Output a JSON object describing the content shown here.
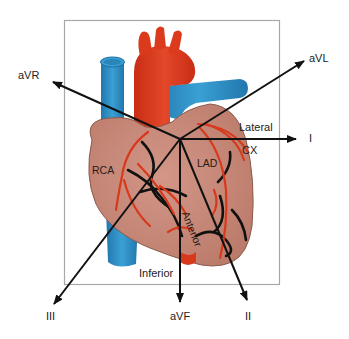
{
  "figure": {
    "type": "hexaxial-reference-diagram",
    "colors": {
      "background": "#ffffff",
      "frame": "#a8a8a8",
      "myocardium": "#c8897a",
      "myocardium_outline": "#8a5a4c",
      "aorta": "#dc3a1c",
      "vena_cava": "#2f8fc4",
      "coronary_artery": "#d8391c",
      "coronary_vein": "#111111",
      "axis_arrow": "#111111",
      "label_text": "#222222"
    },
    "center": {
      "x": 180,
      "y": 139
    }
  },
  "leads": [
    {
      "id": "I",
      "label": "I",
      "angle_deg": 0,
      "tip": [
        296,
        139
      ],
      "label_pos": [
        307,
        134
      ]
    },
    {
      "id": "II",
      "label": "II",
      "angle_deg": 60,
      "tip": [
        247,
        300
      ],
      "label_pos": [
        245,
        313
      ]
    },
    {
      "id": "III",
      "label": "III",
      "angle_deg": 120,
      "tip": [
        54,
        304
      ],
      "label_pos": [
        46,
        313
      ]
    },
    {
      "id": "aVR",
      "label": "aVR",
      "angle_deg": -150,
      "tip": [
        53,
        82
      ],
      "label_pos": [
        18,
        73
      ]
    },
    {
      "id": "aVL",
      "label": "aVL",
      "angle_deg": -30,
      "tip": [
        304,
        61
      ],
      "label_pos": [
        309,
        55
      ]
    },
    {
      "id": "aVF",
      "label": "aVF",
      "angle_deg": 90,
      "tip": [
        180,
        302
      ],
      "label_pos": [
        170,
        313
      ]
    }
  ],
  "regions": [
    {
      "id": "lateral",
      "label": "Lateral",
      "pos": [
        239,
        124
      ]
    },
    {
      "id": "inferior",
      "label": "Inferior",
      "pos": [
        138,
        269
      ]
    },
    {
      "id": "anterior",
      "label": "Anterior",
      "pos": [
        198,
        205
      ],
      "rotation_deg": 68
    }
  ],
  "arteries": [
    {
      "id": "rca",
      "label": "RCA",
      "pos": [
        92,
        163
      ]
    },
    {
      "id": "lad",
      "label": "LAD",
      "pos": [
        197,
        158
      ]
    },
    {
      "id": "cx",
      "label": "CX",
      "pos": [
        242,
        145
      ]
    }
  ]
}
